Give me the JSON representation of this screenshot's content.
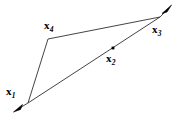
{
  "figure": {
    "type": "geometric-diagram",
    "canvas": {
      "width": 182,
      "height": 121,
      "background": "#ffffff"
    },
    "stroke_color": "#444444",
    "label_color": "#000000",
    "marker_color": "#000000",
    "points": [
      {
        "id": "x1",
        "base": "x",
        "subscript": "1",
        "x": 28,
        "y": 103,
        "label_x": 6,
        "label_y": 87,
        "marker": "none"
      },
      {
        "id": "x2",
        "base": "x",
        "subscript": "2",
        "x": 113,
        "y": 48,
        "label_x": 106,
        "label_y": 53,
        "marker": "dot"
      },
      {
        "id": "x3",
        "base": "x",
        "subscript": "3",
        "x": 160,
        "y": 17,
        "label_x": 152,
        "label_y": 24,
        "marker": "none"
      },
      {
        "id": "x4",
        "base": "x",
        "subscript": "4",
        "x": 48,
        "y": 39,
        "label_x": 44,
        "label_y": 20,
        "marker": "none"
      }
    ],
    "segments": [
      {
        "from": "arrow_tail_bottom",
        "to": "x1"
      },
      {
        "from": "x1",
        "to": "x4"
      },
      {
        "from": "x4",
        "to": "x3"
      },
      {
        "from": "x1",
        "to": "x3"
      },
      {
        "from": "x3",
        "to": "arrow_head_top"
      }
    ],
    "arrows": [
      {
        "id": "arrow-bottom-left",
        "tip_x": 14,
        "tip_y": 111,
        "from_x": 28,
        "from_y": 103,
        "direction": "down-left"
      },
      {
        "id": "arrow-top-right",
        "tip_x": 171,
        "tip_y": 6,
        "from_x": 160,
        "from_y": 17,
        "direction": "up-right"
      }
    ]
  }
}
